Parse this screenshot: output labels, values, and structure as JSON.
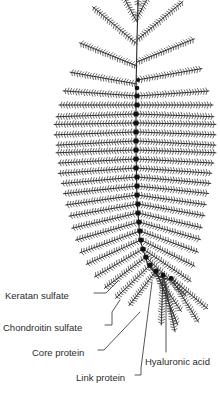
{
  "figure": {
    "background_color": "#ffffff",
    "ink_color": "#2b2b2b",
    "node_color": "#111111",
    "width": 220,
    "height": 395
  },
  "labels": [
    {
      "id": "keratan-sulfate",
      "text": "Keratan sulfate",
      "text_x": 5,
      "text_y": 296,
      "leader": "M 94 293 L 106 293 L 118 281"
    },
    {
      "id": "chondroitin-sulfate",
      "text": "Chondroitin sulfate",
      "text_x": 3,
      "text_y": 328,
      "leader": "M 105 325 L 112 325 L 112 312 L 120 300"
    },
    {
      "id": "core-protein",
      "text": "Core protein",
      "text_x": 32,
      "text_y": 353,
      "leader": "M 98 350 L 104 350 L 140 312"
    },
    {
      "id": "link-protein",
      "text": "Link protein",
      "text_x": 76,
      "text_y": 378,
      "leader": "M 135 375 L 141 375 L 141 368 L 152 282"
    },
    {
      "id": "hyaluronic-acid",
      "text": "Hyaluronic acid",
      "text_x": 145,
      "text_y": 362,
      "leader": "M 166 352 L 166 282"
    }
  ],
  "chart_data": {
    "type": "diagram",
    "backbone": {
      "name": "hyaluronic-acid-backbone",
      "path": "M 138 2 L 137 40 L 136 90 L 136 150 L 137 200 L 140 240 L 148 265 L 158 276 L 170 280",
      "node_count": 30
    },
    "nodes": [
      {
        "x": 137,
        "y": 96,
        "r": 2.4
      },
      {
        "x": 137,
        "y": 105,
        "r": 2.5
      },
      {
        "x": 136,
        "y": 114,
        "r": 2.5
      },
      {
        "x": 136,
        "y": 123,
        "r": 2.5
      },
      {
        "x": 136,
        "y": 132,
        "r": 2.5
      },
      {
        "x": 136,
        "y": 141,
        "r": 2.5
      },
      {
        "x": 136,
        "y": 150,
        "r": 2.5
      },
      {
        "x": 136,
        "y": 159,
        "r": 2.5
      },
      {
        "x": 136,
        "y": 168,
        "r": 2.5
      },
      {
        "x": 137,
        "y": 177,
        "r": 2.5
      },
      {
        "x": 137,
        "y": 186,
        "r": 2.5
      },
      {
        "x": 137,
        "y": 195,
        "r": 2.5
      },
      {
        "x": 138,
        "y": 204,
        "r": 2.5
      },
      {
        "x": 138,
        "y": 213,
        "r": 2.5
      },
      {
        "x": 139,
        "y": 222,
        "r": 2.5
      },
      {
        "x": 140,
        "y": 231,
        "r": 2.5
      },
      {
        "x": 141,
        "y": 240,
        "r": 2.5
      },
      {
        "x": 143,
        "y": 249,
        "r": 2.5
      },
      {
        "x": 146,
        "y": 257,
        "r": 2.5
      },
      {
        "x": 150,
        "y": 265,
        "r": 2.6
      },
      {
        "x": 156,
        "y": 271,
        "r": 2.6
      },
      {
        "x": 163,
        "y": 275,
        "r": 2.4
      },
      {
        "x": 171,
        "y": 278,
        "r": 2.2
      },
      {
        "x": 137,
        "y": 88,
        "r": 2.3
      },
      {
        "x": 138,
        "y": 80,
        "r": 2.0
      }
    ],
    "arms": [
      {
        "x": 138,
        "y": 6,
        "angle": -90,
        "len": 60,
        "teeth": 22,
        "side": "both"
      },
      {
        "x": 137,
        "y": 18,
        "angle": -62,
        "len": 58,
        "teeth": 21,
        "side": "both"
      },
      {
        "x": 137,
        "y": 22,
        "angle": -118,
        "len": 56,
        "teeth": 20,
        "side": "both"
      },
      {
        "x": 137,
        "y": 40,
        "angle": -40,
        "len": 60,
        "teeth": 22,
        "side": "both"
      },
      {
        "x": 137,
        "y": 44,
        "angle": -140,
        "len": 58,
        "teeth": 21,
        "side": "both"
      },
      {
        "x": 137,
        "y": 62,
        "angle": -22,
        "len": 62,
        "teeth": 23,
        "side": "both"
      },
      {
        "x": 137,
        "y": 66,
        "angle": -158,
        "len": 62,
        "teeth": 23,
        "side": "both"
      },
      {
        "x": 137,
        "y": 80,
        "angle": -10,
        "len": 66,
        "teeth": 24,
        "side": "both"
      },
      {
        "x": 137,
        "y": 84,
        "angle": -170,
        "len": 68,
        "teeth": 25,
        "side": "both"
      },
      {
        "x": 137,
        "y": 96,
        "angle": -4,
        "len": 72,
        "teeth": 26,
        "side": "both"
      },
      {
        "x": 137,
        "y": 96,
        "angle": -176,
        "len": 74,
        "teeth": 27,
        "side": "both"
      },
      {
        "x": 137,
        "y": 105,
        "angle": 0,
        "len": 76,
        "teeth": 27,
        "side": "both"
      },
      {
        "x": 137,
        "y": 105,
        "angle": 180,
        "len": 78,
        "teeth": 28,
        "side": "both"
      },
      {
        "x": 136,
        "y": 114,
        "angle": 2,
        "len": 78,
        "teeth": 28,
        "side": "both"
      },
      {
        "x": 136,
        "y": 114,
        "angle": 178,
        "len": 80,
        "teeth": 29,
        "side": "both"
      },
      {
        "x": 136,
        "y": 123,
        "angle": 1,
        "len": 80,
        "teeth": 29,
        "side": "both"
      },
      {
        "x": 136,
        "y": 123,
        "angle": 179,
        "len": 82,
        "teeth": 29,
        "side": "both"
      },
      {
        "x": 136,
        "y": 132,
        "angle": 2,
        "len": 80,
        "teeth": 29,
        "side": "both"
      },
      {
        "x": 136,
        "y": 132,
        "angle": 178,
        "len": 82,
        "teeth": 29,
        "side": "both"
      },
      {
        "x": 136,
        "y": 141,
        "angle": 3,
        "len": 80,
        "teeth": 29,
        "side": "both"
      },
      {
        "x": 136,
        "y": 141,
        "angle": 177,
        "len": 80,
        "teeth": 29,
        "side": "both"
      },
      {
        "x": 136,
        "y": 150,
        "angle": 2,
        "len": 80,
        "teeth": 29,
        "side": "both"
      },
      {
        "x": 136,
        "y": 150,
        "angle": 178,
        "len": 80,
        "teeth": 29,
        "side": "both"
      },
      {
        "x": 136,
        "y": 159,
        "angle": 3,
        "len": 78,
        "teeth": 28,
        "side": "both"
      },
      {
        "x": 136,
        "y": 159,
        "angle": 177,
        "len": 78,
        "teeth": 28,
        "side": "both"
      },
      {
        "x": 136,
        "y": 168,
        "angle": 4,
        "len": 76,
        "teeth": 27,
        "side": "both"
      },
      {
        "x": 136,
        "y": 168,
        "angle": 176,
        "len": 78,
        "teeth": 28,
        "side": "both"
      },
      {
        "x": 137,
        "y": 177,
        "angle": 5,
        "len": 74,
        "teeth": 27,
        "side": "both"
      },
      {
        "x": 137,
        "y": 177,
        "angle": 175,
        "len": 76,
        "teeth": 27,
        "side": "both"
      },
      {
        "x": 137,
        "y": 186,
        "angle": 6,
        "len": 72,
        "teeth": 26,
        "side": "both"
      },
      {
        "x": 137,
        "y": 186,
        "angle": 174,
        "len": 74,
        "teeth": 27,
        "side": "both"
      },
      {
        "x": 137,
        "y": 195,
        "angle": 8,
        "len": 70,
        "teeth": 25,
        "side": "both"
      },
      {
        "x": 137,
        "y": 195,
        "angle": 172,
        "len": 72,
        "teeth": 26,
        "side": "both"
      },
      {
        "x": 138,
        "y": 204,
        "angle": 10,
        "len": 68,
        "teeth": 25,
        "side": "both"
      },
      {
        "x": 138,
        "y": 204,
        "angle": 170,
        "len": 70,
        "teeth": 25,
        "side": "both"
      },
      {
        "x": 138,
        "y": 213,
        "angle": 13,
        "len": 66,
        "teeth": 24,
        "side": "both"
      },
      {
        "x": 138,
        "y": 213,
        "angle": 167,
        "len": 68,
        "teeth": 25,
        "side": "both"
      },
      {
        "x": 139,
        "y": 222,
        "angle": 16,
        "len": 64,
        "teeth": 23,
        "side": "both"
      },
      {
        "x": 139,
        "y": 222,
        "angle": 164,
        "len": 66,
        "teeth": 24,
        "side": "both"
      },
      {
        "x": 140,
        "y": 231,
        "angle": 20,
        "len": 62,
        "teeth": 22,
        "side": "both"
      },
      {
        "x": 140,
        "y": 231,
        "angle": 160,
        "len": 64,
        "teeth": 23,
        "side": "both"
      },
      {
        "x": 141,
        "y": 240,
        "angle": 26,
        "len": 60,
        "teeth": 22,
        "side": "both"
      },
      {
        "x": 141,
        "y": 240,
        "angle": 156,
        "len": 60,
        "teeth": 22,
        "side": "both"
      },
      {
        "x": 143,
        "y": 249,
        "angle": 34,
        "len": 58,
        "teeth": 21,
        "side": "both"
      },
      {
        "x": 143,
        "y": 249,
        "angle": 150,
        "len": 56,
        "teeth": 20,
        "side": "both"
      },
      {
        "x": 146,
        "y": 257,
        "angle": 44,
        "len": 56,
        "teeth": 20,
        "side": "both"
      },
      {
        "x": 146,
        "y": 257,
        "angle": 143,
        "len": 52,
        "teeth": 19,
        "side": "both"
      },
      {
        "x": 150,
        "y": 265,
        "angle": 56,
        "len": 56,
        "teeth": 20,
        "side": "both"
      },
      {
        "x": 150,
        "y": 265,
        "angle": 136,
        "len": 48,
        "teeth": 17,
        "side": "both"
      },
      {
        "x": 156,
        "y": 271,
        "angle": 68,
        "len": 58,
        "teeth": 21,
        "side": "both"
      },
      {
        "x": 156,
        "y": 271,
        "angle": 128,
        "len": 44,
        "teeth": 16,
        "side": "both"
      },
      {
        "x": 163,
        "y": 275,
        "angle": 78,
        "len": 58,
        "teeth": 21,
        "side": "both"
      },
      {
        "x": 171,
        "y": 278,
        "angle": 58,
        "len": 52,
        "teeth": 19,
        "side": "both"
      },
      {
        "x": 171,
        "y": 278,
        "angle": 40,
        "len": 48,
        "teeth": 17,
        "side": "both"
      },
      {
        "x": 163,
        "y": 275,
        "angle": 92,
        "len": 50,
        "teeth": 18,
        "side": "both"
      }
    ]
  }
}
